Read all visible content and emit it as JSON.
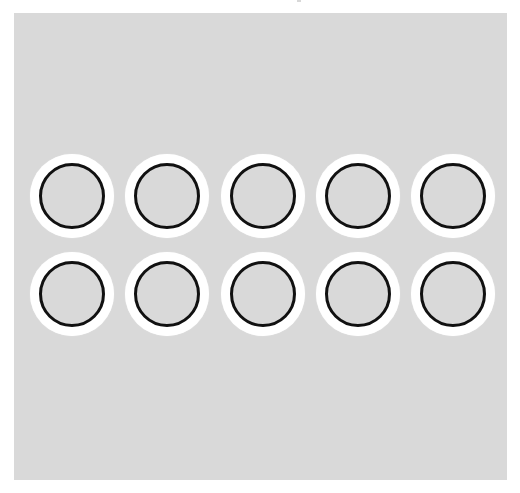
{
  "colors": {
    "page_background": "#ffffff",
    "panel_background": "#d9d9d9",
    "token_ring": "#ffffff",
    "token_outline": "#111111",
    "token_fill": "#d9d9d9"
  },
  "grid": {
    "rows": 2,
    "columns": 5,
    "column_centers_x": [
      72,
      167,
      263,
      358,
      453
    ],
    "row_centers_y": [
      196,
      294
    ]
  },
  "tokens": [
    {
      "row": 1,
      "col": 1,
      "state": "empty"
    },
    {
      "row": 1,
      "col": 2,
      "state": "empty"
    },
    {
      "row": 1,
      "col": 3,
      "state": "empty"
    },
    {
      "row": 1,
      "col": 4,
      "state": "empty"
    },
    {
      "row": 1,
      "col": 5,
      "state": "empty"
    },
    {
      "row": 2,
      "col": 1,
      "state": "empty"
    },
    {
      "row": 2,
      "col": 2,
      "state": "empty"
    },
    {
      "row": 2,
      "col": 3,
      "state": "empty"
    },
    {
      "row": 2,
      "col": 4,
      "state": "empty"
    },
    {
      "row": 2,
      "col": 5,
      "state": "empty"
    }
  ]
}
